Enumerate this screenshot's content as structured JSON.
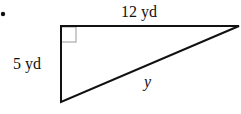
{
  "diagram": {
    "type": "right-triangle",
    "bullet": "•",
    "labels": {
      "top": "12 yd",
      "left": "5 yd",
      "hypotenuse": "y"
    },
    "right_angle_marker": true,
    "colors": {
      "stroke": "#111111",
      "marker": "#999999"
    }
  }
}
